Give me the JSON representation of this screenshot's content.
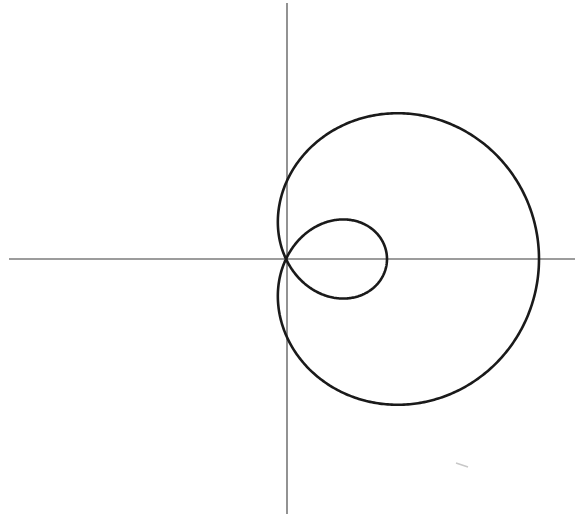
{
  "diagram": {
    "type": "polar-curve",
    "curve": {
      "name": "limacon-with-inner-loop",
      "equation": "r = b + a cos(theta)",
      "a": 177,
      "b": 76,
      "stroke": "#1a1a1a",
      "stroke_width": 2.6
    },
    "origin": {
      "x": 286,
      "y": 259
    },
    "axes": {
      "color": "#3a3a3a",
      "width": 1.1,
      "horizontal": {
        "x1": 9,
        "x2": 575,
        "y": 259
      },
      "vertical": {
        "x": 287,
        "y1": 3,
        "y2": 514
      }
    },
    "background": "#ffffff"
  }
}
